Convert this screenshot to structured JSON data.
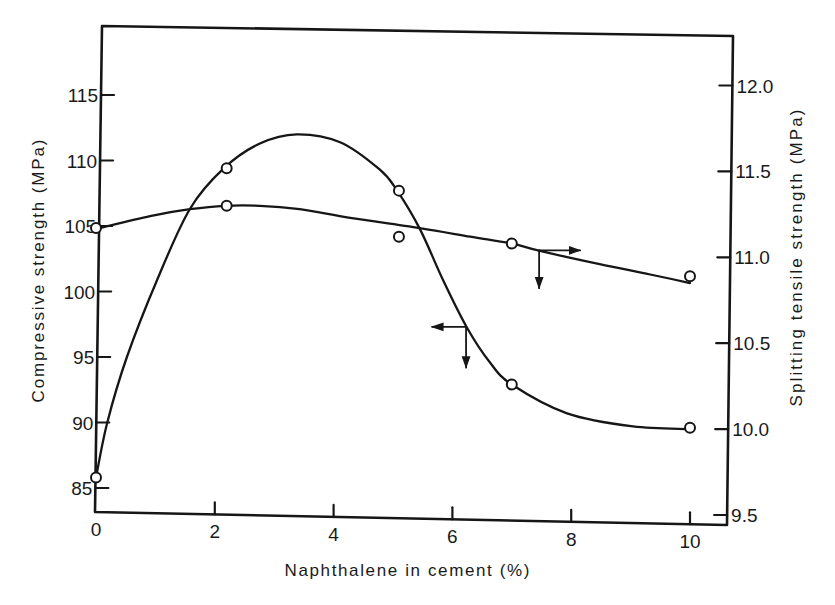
{
  "chart_data": {
    "type": "line",
    "title": "",
    "xlabel": "Naphthalene in cement (%)",
    "ylabel": "Compressive strength (MPa)",
    "ylabel_right": "Splitting tensile strength (MPa)",
    "xlim": [
      0,
      10.5
    ],
    "ylim": [
      83.2,
      119.8
    ],
    "ylim_right": [
      9.44,
      12.5
    ],
    "grid": false,
    "legend": null,
    "x_ticks": [
      0,
      2,
      4,
      6,
      8,
      10
    ],
    "x_tick_labels": [
      "0",
      "2",
      "4",
      "6",
      "8",
      "10"
    ],
    "y_ticks": [
      85,
      90,
      95,
      100,
      105,
      110,
      115
    ],
    "y_tick_labels": [
      "85",
      "90",
      "95",
      "100",
      "105",
      "110",
      "115"
    ],
    "y_ticks_right": [
      9.5,
      10.0,
      10.5,
      11.0,
      11.5,
      12.0
    ],
    "y_tick_labels_right": [
      "9.5",
      "10.0",
      "10.5",
      "11.0",
      "11.5",
      "12.0"
    ],
    "series": [
      {
        "name": "Compressive strength",
        "axis": "left",
        "marker": "open-circle",
        "x": [
          0,
          2.2,
          5.1,
          7.0,
          10.0
        ],
        "values": [
          85.8,
          109.4,
          107.7,
          92.9,
          89.6
        ],
        "fitted_curve": [
          [
            0,
            85.8
          ],
          [
            0.19,
            90.0
          ],
          [
            0.52,
            95.0
          ],
          [
            1.03,
            100.9
          ],
          [
            1.58,
            106.3
          ],
          [
            2.15,
            109.4
          ],
          [
            2.76,
            111.3
          ],
          [
            3.38,
            112.0
          ],
          [
            4.11,
            111.4
          ],
          [
            4.78,
            109.3
          ],
          [
            5.07,
            107.7
          ],
          [
            5.45,
            104.8
          ],
          [
            5.84,
            100.9
          ],
          [
            6.25,
            97.2
          ],
          [
            6.63,
            94.6
          ],
          [
            7.0,
            92.9
          ],
          [
            7.93,
            90.7
          ],
          [
            9.04,
            89.7
          ],
          [
            10.0,
            89.5
          ]
        ]
      },
      {
        "name": "Splitting tensile strength",
        "axis": "right",
        "marker": "open-circle",
        "x": [
          0,
          2.2,
          5.1,
          7.0,
          10.0
        ],
        "values": [
          11.17,
          11.3,
          11.12,
          11.08,
          10.89
        ],
        "fitted_curve": [
          [
            0.07,
            11.17
          ],
          [
            0.91,
            11.24
          ],
          [
            1.58,
            11.28
          ],
          [
            2.17,
            11.3
          ],
          [
            2.76,
            11.3
          ],
          [
            3.43,
            11.28
          ],
          [
            4.28,
            11.23
          ],
          [
            5.45,
            11.17
          ],
          [
            6.3,
            11.12
          ],
          [
            7.0,
            11.08
          ],
          [
            7.44,
            11.04
          ],
          [
            8.48,
            10.96
          ],
          [
            9.33,
            10.9
          ],
          [
            10.0,
            10.85
          ]
        ]
      }
    ],
    "annotations": [
      {
        "type": "axis-indicator-arrow",
        "series": "Compressive strength",
        "axis": "left",
        "direction": "left",
        "x": 6.23,
        "y": 97.3,
        "x_end": 5.66,
        "y_end": 94.2
      },
      {
        "type": "axis-indicator-arrow",
        "series": "Splitting tensile strength",
        "axis": "right",
        "direction": "right",
        "x": 7.46,
        "y": 11.04,
        "x_end": 8.15,
        "y_end": 10.82
      }
    ]
  }
}
